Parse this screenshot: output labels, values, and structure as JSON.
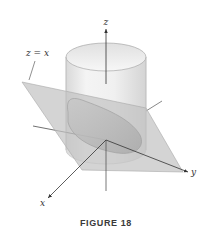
{
  "figure": {
    "caption": "FIGURE 18",
    "plane_label": "z = x",
    "axes": {
      "x": "x",
      "y": "y",
      "z": "z"
    },
    "colors": {
      "plane": "#c8c8c8",
      "cylinder": "#e6e6e6",
      "ellipse": "#b4b4b4",
      "axis": "#333333"
    }
  }
}
